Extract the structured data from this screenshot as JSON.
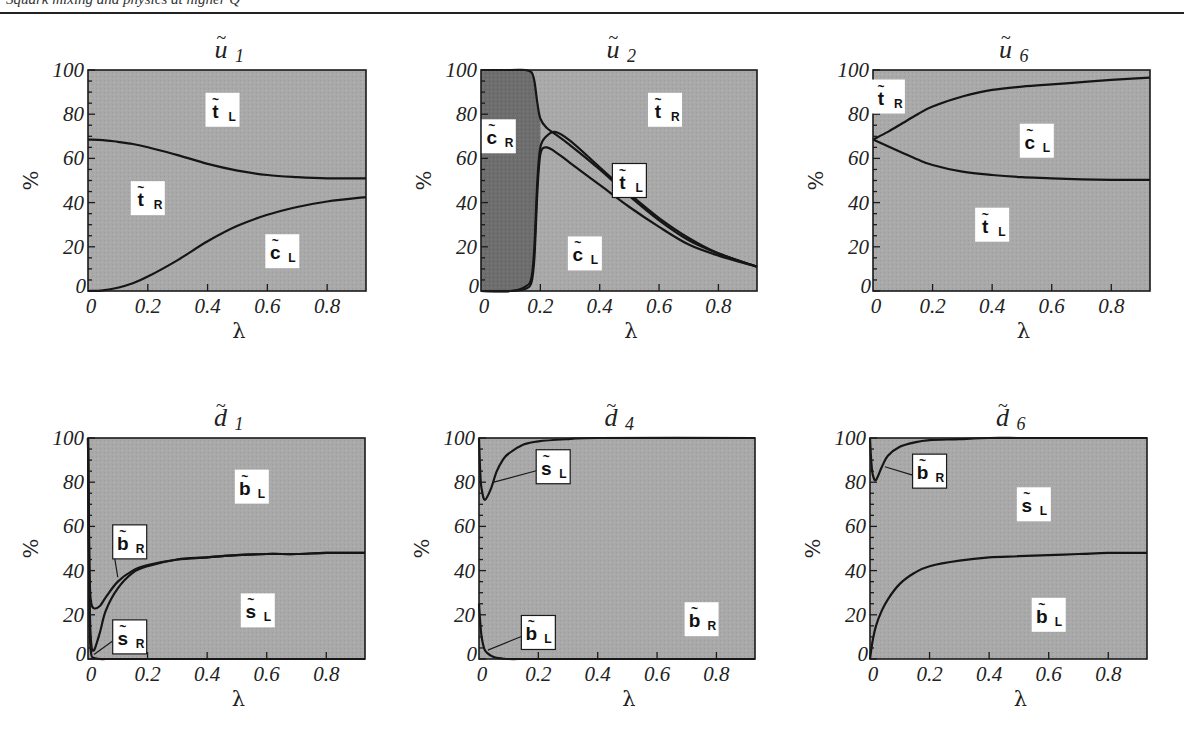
{
  "header": {
    "text": "Squark mixing and physics at higher Q"
  },
  "colors": {
    "plot_fill": "#a9a9a9",
    "dark_fill": "#6e6e6e",
    "curve": "#151515",
    "label_bg": "#ffffff"
  },
  "chart_data": [
    {
      "type": "area",
      "title": "ũ₁",
      "title_base": "u",
      "title_sub": "1",
      "xlabel": "λ",
      "ylabel": "%",
      "xlim": [
        0,
        0.93
      ],
      "ylim": [
        0,
        100
      ],
      "xticks": [
        "0",
        "0.2",
        "0.4",
        "0.6",
        "0.8"
      ],
      "yticks": [
        "0",
        "20",
        "40",
        "60",
        "80",
        "100"
      ],
      "grid": false,
      "x": [
        0,
        0.05,
        0.1,
        0.15,
        0.2,
        0.3,
        0.4,
        0.5,
        0.6,
        0.7,
        0.8,
        0.93
      ],
      "series": [
        {
          "name": "c̃L (below lower curve)",
          "values": [
            0,
            0.3,
            1.5,
            3.5,
            6.5,
            14,
            22.5,
            29.5,
            34.5,
            38,
            40.5,
            42.5
          ]
        },
        {
          "name": "c̃L + t̃R (upper curve)",
          "values": [
            68.5,
            68.3,
            67.5,
            66.5,
            65,
            61.5,
            57.5,
            54.5,
            52.5,
            51.5,
            51,
            51
          ]
        }
      ],
      "regions": [
        {
          "label": "t̃L",
          "base": "t",
          "sub": "L",
          "x": 0.45,
          "y": 82,
          "boxed": false
        },
        {
          "label": "t̃R",
          "base": "t",
          "sub": "R",
          "x": 0.2,
          "y": 42,
          "boxed": false
        },
        {
          "label": "c̃L",
          "base": "c",
          "sub": "L",
          "x": 0.65,
          "y": 18,
          "boxed": false
        }
      ]
    },
    {
      "type": "area",
      "title": "ũ₂",
      "title_base": "u",
      "title_sub": "2",
      "xlabel": "λ",
      "ylabel": "%",
      "xlim": [
        0,
        0.93
      ],
      "ylim": [
        0,
        100
      ],
      "xticks": [
        "0",
        "0.2",
        "0.4",
        "0.6",
        "0.8"
      ],
      "yticks": [
        "0",
        "20",
        "40",
        "60",
        "80",
        "100"
      ],
      "grid": false,
      "x": [
        0,
        0.1,
        0.15,
        0.17,
        0.18,
        0.19,
        0.2,
        0.22,
        0.25,
        0.3,
        0.4,
        0.5,
        0.6,
        0.7,
        0.8,
        0.93
      ],
      "series": [
        {
          "name": "c̃R boundary (top of dark region)",
          "values": [
            100,
            100,
            100,
            99,
            95,
            85,
            78,
            74,
            71,
            66,
            55,
            43,
            32,
            23,
            17,
            11
          ]
        },
        {
          "name": "c̃R boundary (right of dark region, bottom)",
          "values": [
            0,
            0,
            2,
            6,
            20,
            50,
            65,
            70,
            72,
            68,
            56,
            44,
            33,
            24,
            17,
            11
          ]
        },
        {
          "name": "c̃L upper curve",
          "values": [
            0,
            0,
            1,
            4,
            15,
            45,
            62,
            65,
            63,
            58,
            48,
            38,
            29,
            21,
            16,
            11
          ]
        }
      ],
      "regions": [
        {
          "label": "c̃R",
          "base": "c",
          "sub": "R",
          "x": 0.06,
          "y": 70,
          "boxed": false
        },
        {
          "label": "t̃R",
          "base": "t",
          "sub": "R",
          "x": 0.62,
          "y": 82,
          "boxed": false
        },
        {
          "label": "t̃L",
          "base": "t",
          "sub": "L",
          "x": 0.5,
          "y": 50,
          "boxed": true,
          "pointer": [
            0.45,
            42
          ]
        },
        {
          "label": "c̃L",
          "base": "c",
          "sub": "L",
          "x": 0.35,
          "y": 17,
          "boxed": false
        }
      ]
    },
    {
      "type": "area",
      "title": "ũ₆",
      "title_base": "u",
      "title_sub": "6",
      "xlabel": "λ",
      "ylabel": "%",
      "xlim": [
        0,
        0.93
      ],
      "ylim": [
        0,
        100
      ],
      "xticks": [
        "0",
        "0.2",
        "0.4",
        "0.6",
        "0.8"
      ],
      "yticks": [
        "0",
        "20",
        "40",
        "60",
        "80",
        "100"
      ],
      "grid": false,
      "x": [
        0,
        0.05,
        0.1,
        0.15,
        0.2,
        0.3,
        0.4,
        0.5,
        0.6,
        0.7,
        0.8,
        0.93
      ],
      "series": [
        {
          "name": "t̃L (below lower curve)",
          "values": [
            68.5,
            65.5,
            62.5,
            59.5,
            57,
            54,
            52.5,
            51.5,
            51,
            50.5,
            50.3,
            50.3
          ]
        },
        {
          "name": "t̃L + c̃L (upper curve)",
          "values": [
            68.5,
            72,
            76,
            80,
            83.5,
            88,
            91,
            92.5,
            93.5,
            94.5,
            95.5,
            96.5
          ]
        }
      ],
      "regions": [
        {
          "label": "t̃R",
          "base": "t",
          "sub": "R",
          "x": 0.05,
          "y": 88,
          "boxed": false
        },
        {
          "label": "c̃L",
          "base": "c",
          "sub": "L",
          "x": 0.55,
          "y": 68,
          "boxed": false
        },
        {
          "label": "t̃L",
          "base": "t",
          "sub": "L",
          "x": 0.4,
          "y": 30,
          "boxed": false
        }
      ]
    },
    {
      "type": "area",
      "title": "d̃₁",
      "title_base": "d",
      "title_sub": "1",
      "xlabel": "λ",
      "ylabel": "%",
      "xlim": [
        0,
        0.93
      ],
      "ylim": [
        0,
        100
      ],
      "xticks": [
        "0",
        "0.2",
        "0.4",
        "0.6",
        "0.8"
      ],
      "yticks": [
        "0",
        "20",
        "40",
        "60",
        "80",
        "100"
      ],
      "grid": false,
      "x": [
        0,
        0.005,
        0.01,
        0.02,
        0.04,
        0.06,
        0.1,
        0.15,
        0.2,
        0.3,
        0.4,
        0.5,
        0.6,
        0.7,
        0.8,
        0.93
      ],
      "series": [
        {
          "name": "s̃R (lowest curve)",
          "values": [
            100,
            20,
            3,
            0.5,
            0,
            0,
            0,
            0,
            0,
            0,
            0,
            0,
            0,
            0,
            0,
            0
          ]
        },
        {
          "name": "s̃R + s̃L (middle curve)",
          "values": [
            100,
            30,
            8,
            4,
            12,
            22,
            32,
            39,
            42,
            45,
            46,
            47,
            47.5,
            47.5,
            48,
            48
          ]
        },
        {
          "name": "b̃R boundary (upper curve)",
          "values": [
            100,
            40,
            26,
            23,
            24,
            28,
            35,
            40,
            42.5,
            45,
            46,
            47,
            47.5,
            47.5,
            48,
            48
          ]
        }
      ],
      "regions": [
        {
          "label": "b̃L",
          "base": "b",
          "sub": "L",
          "x": 0.55,
          "y": 78,
          "boxed": false
        },
        {
          "label": "b̃R",
          "base": "b",
          "sub": "R",
          "x": 0.14,
          "y": 53,
          "boxed": true,
          "pointer": [
            0.1,
            37
          ]
        },
        {
          "label": "s̃L",
          "base": "s",
          "sub": "L",
          "x": 0.57,
          "y": 22,
          "boxed": false
        },
        {
          "label": "s̃R",
          "base": "s",
          "sub": "R",
          "x": 0.14,
          "y": 10,
          "boxed": true,
          "pointer": [
            0.02,
            2
          ]
        }
      ]
    },
    {
      "type": "area",
      "title": "d̃₄",
      "title_base": "d",
      "title_sub": "4",
      "xlabel": "λ",
      "ylabel": "%",
      "xlim": [
        0,
        0.93
      ],
      "ylim": [
        0,
        100
      ],
      "xticks": [
        "0",
        "0.2",
        "0.4",
        "0.6",
        "0.8"
      ],
      "yticks": [
        "0",
        "20",
        "40",
        "60",
        "80",
        "100"
      ],
      "grid": false,
      "x": [
        0,
        0.005,
        0.01,
        0.02,
        0.04,
        0.06,
        0.08,
        0.1,
        0.15,
        0.2,
        0.3,
        0.4,
        0.93
      ],
      "series": [
        {
          "name": "b̃L (lower curve)",
          "values": [
            25,
            15,
            9,
            4,
            1.5,
            0.5,
            0.2,
            0,
            0,
            0,
            0,
            0,
            0
          ]
        },
        {
          "name": "s̃L boundary (upper curve)",
          "values": [
            100,
            82,
            76,
            72,
            77,
            85,
            90,
            93,
            97,
            98.5,
            99.5,
            100,
            100
          ]
        }
      ],
      "regions": [
        {
          "label": "s̃L",
          "base": "s",
          "sub": "L",
          "x": 0.25,
          "y": 87,
          "boxed": true,
          "pointer": [
            0.05,
            80
          ]
        },
        {
          "label": "b̃L",
          "base": "b",
          "sub": "L",
          "x": 0.2,
          "y": 12,
          "boxed": true,
          "pointer": [
            0.03,
            4
          ]
        },
        {
          "label": "b̃R",
          "base": "b",
          "sub": "R",
          "x": 0.75,
          "y": 18,
          "boxed": false
        }
      ]
    },
    {
      "type": "area",
      "title": "d̃₆",
      "title_base": "d",
      "title_sub": "6",
      "xlabel": "λ",
      "ylabel": "%",
      "xlim": [
        0,
        0.93
      ],
      "ylim": [
        0,
        100
      ],
      "xticks": [
        "0",
        "0.2",
        "0.4",
        "0.6",
        "0.8"
      ],
      "yticks": [
        "0",
        "20",
        "40",
        "60",
        "80",
        "100"
      ],
      "grid": false,
      "x": [
        0,
        0.005,
        0.01,
        0.02,
        0.04,
        0.06,
        0.1,
        0.15,
        0.2,
        0.3,
        0.4,
        0.5,
        0.6,
        0.7,
        0.8,
        0.93
      ],
      "series": [
        {
          "name": "b̃L (lower curve)",
          "values": [
            0,
            5,
            9,
            15,
            22,
            27,
            34,
            39,
            42,
            44.5,
            46,
            46.5,
            47,
            47.5,
            48,
            48
          ]
        },
        {
          "name": "b̃R boundary (upper curve)",
          "values": [
            100,
            88,
            83,
            81,
            87,
            92,
            96,
            98,
            99,
            99.5,
            100,
            100,
            100,
            100,
            100,
            100
          ]
        }
      ],
      "regions": [
        {
          "label": "b̃R",
          "base": "b",
          "sub": "R",
          "x": 0.2,
          "y": 85,
          "boxed": true,
          "pointer": [
            0.05,
            87
          ]
        },
        {
          "label": "s̃L",
          "base": "s",
          "sub": "L",
          "x": 0.55,
          "y": 70,
          "boxed": false
        },
        {
          "label": "b̃L",
          "base": "b",
          "sub": "L",
          "x": 0.6,
          "y": 20,
          "boxed": false
        }
      ]
    }
  ]
}
